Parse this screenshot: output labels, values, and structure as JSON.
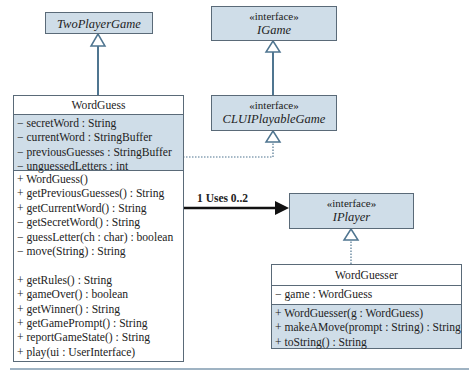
{
  "diagram": {
    "classes": {
      "two_player_game": {
        "name": "TwoPlayerGame",
        "abstract": true
      },
      "igame": {
        "stereotype": "«interface»",
        "name": "IGame"
      },
      "clui_playable_game": {
        "stereotype": "«interface»",
        "name": "CLUIPlayableGame"
      },
      "iplayer": {
        "stereotype": "«interface»",
        "name": "IPlayer"
      },
      "word_guess": {
        "name": "WordGuess",
        "attributes": [
          "− secretWord : String",
          "− currentWord : StringBuffer",
          "− previousGuesses : StringBuffer",
          "− unguessedLetters : int"
        ],
        "methods": [
          "+ WordGuess()",
          "+ getPreviousGuesses() : String",
          "+ getCurrentWord() : String",
          "− getSecretWord() : String",
          "− guessLetter(ch : char) : boolean",
          "− move(String) : String",
          "",
          "+ getRules() : String",
          "+ gameOver() : boolean",
          "+ getWinner() : String",
          "+ getGamePrompt() : String",
          "+ reportGameState() : String",
          "+ play(ui : UserInterface)"
        ]
      },
      "word_guesser": {
        "name": "WordGuesser",
        "attributes": [
          "− game : WordGuess"
        ],
        "methods": [
          "+ WordGuesser(g : WordGuess)",
          "+ makeAMove(prompt : String) : String",
          "+ toString() : String"
        ]
      }
    },
    "associations": {
      "uses_label": "1 Uses 0..2"
    },
    "colors": {
      "shaded_fill": "#cfdde8",
      "line": "#4f7590",
      "border": "#5a6a78"
    }
  }
}
